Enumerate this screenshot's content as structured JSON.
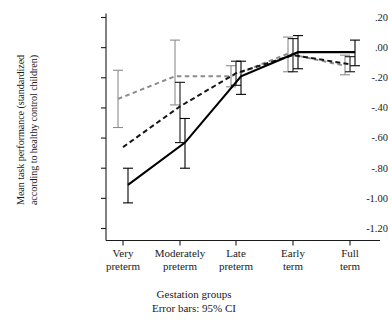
{
  "chart_data": {
    "type": "line",
    "title": "",
    "xlabel": "Gestation groups",
    "ylabel": "Mean task performance (standardized according to healthy control children)",
    "ylabel_line1": "Mean task performance (standardized",
    "ylabel_line2": "according to healthy control children)",
    "annotation": "Error bars: 95% CI",
    "categories": [
      "Very preterm",
      "Moderately preterm",
      "Late preterm",
      "Early term",
      "Full term"
    ],
    "category_lines": [
      [
        "Very",
        "preterm"
      ],
      [
        "Moderately",
        "preterm"
      ],
      [
        "Late",
        "preterm"
      ],
      [
        "Early",
        "term"
      ],
      [
        "Full",
        "term"
      ]
    ],
    "ylim": [
      -1.2,
      0.2
    ],
    "yticks": [
      0.2,
      0.0,
      -0.2,
      -0.4,
      -0.6,
      -0.8,
      -1.0,
      -1.2
    ],
    "ytick_labels": [
      ".20",
      ".00",
      "-.20",
      "-.40",
      "-.60",
      "-.80",
      "-1.00",
      "-1.20"
    ],
    "grid": false,
    "legend_position": "none",
    "series": [
      {
        "name": "series-grey-dashed",
        "style": "dashed",
        "color": "#8c8c8c",
        "values": [
          -0.34,
          -0.19,
          -0.19,
          -0.04,
          -0.12
        ],
        "ci_low": [
          -0.53,
          -0.38,
          -0.26,
          -0.16,
          -0.18
        ],
        "ci_high": [
          -0.15,
          0.05,
          -0.12,
          0.07,
          -0.05
        ],
        "has_errorbars": [
          true,
          true,
          true,
          true,
          true
        ]
      },
      {
        "name": "series-black-dashed",
        "style": "dashed",
        "color": "#161616",
        "values": [
          -0.66,
          -0.39,
          -0.17,
          -0.05,
          -0.11
        ],
        "ci_low": [
          -0.66,
          -0.63,
          -0.25,
          -0.16,
          -0.16
        ],
        "ci_high": [
          -0.66,
          -0.23,
          -0.09,
          0.06,
          -0.06
        ],
        "has_errorbars": [
          false,
          true,
          true,
          true,
          true
        ]
      },
      {
        "name": "series-black-solid",
        "style": "solid",
        "color": "#000000",
        "values": [
          -0.91,
          -0.63,
          -0.19,
          -0.03,
          -0.03
        ],
        "ci_low": [
          -1.03,
          -0.8,
          -0.31,
          -0.14,
          -0.12
        ],
        "ci_high": [
          -0.8,
          -0.47,
          -0.09,
          0.08,
          0.05
        ],
        "has_errorbars": [
          true,
          true,
          true,
          true,
          true
        ]
      }
    ]
  },
  "axis": {
    "y_title_line1": "Mean task performance (standardized",
    "y_title_line2": "according to healthy control children)",
    "x_title": "Gestation groups",
    "error_note": "Error bars: 95% CI"
  }
}
